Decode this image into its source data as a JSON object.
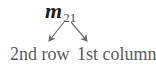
{
  "diagram": {
    "symbol": {
      "base": "m",
      "subscript": "21"
    },
    "labels": {
      "row": "2nd row",
      "column": "1st column"
    },
    "arrows": [
      {
        "from": "subscript-2",
        "to": "2nd row"
      },
      {
        "from": "subscript-1",
        "to": "1st column"
      }
    ],
    "colors": {
      "symbol": "#231f20",
      "text": "#5a5a5a",
      "arrow": "#6d6d6d"
    }
  }
}
